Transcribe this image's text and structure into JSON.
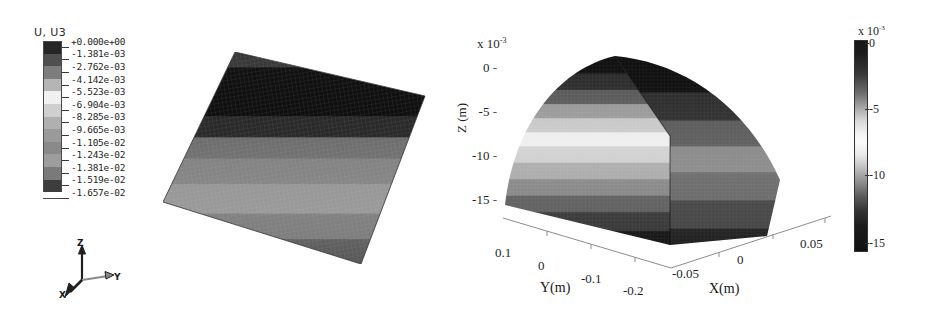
{
  "left_panel": {
    "legend_title": "U, U3",
    "legend_entries": [
      {
        "label": "+0.000e+00",
        "color": "#262626"
      },
      {
        "label": "-1.381e-03",
        "color": "#4f4f4f"
      },
      {
        "label": "-2.762e-03",
        "color": "#7d7d7d"
      },
      {
        "label": "-4.142e-03",
        "color": "#b5b5b5"
      },
      {
        "label": "-5.523e-03",
        "color": "#f0f0f0"
      },
      {
        "label": "-6.904e-03",
        "color": "#cfcfcf"
      },
      {
        "label": "-8.285e-03",
        "color": "#b0b0b0"
      },
      {
        "label": "-9.665e-03",
        "color": "#9a9a9a"
      },
      {
        "label": "-1.105e-02",
        "color": "#8a8a8a"
      },
      {
        "label": "-1.243e-02",
        "color": "#9d9d9d"
      },
      {
        "label": "-1.381e-02",
        "color": "#7a7a7a"
      },
      {
        "label": "-1.519e-02",
        "color": "#3d3d3d"
      },
      {
        "label": "-1.657e-02",
        "color": "#151515"
      }
    ],
    "triad": {
      "z_label": "Z",
      "y_label": "Y",
      "x_label": "X"
    }
  },
  "right_panel": {
    "z_exponent_prefix": "x 10",
    "z_exponent": "-3",
    "z_axis_label": "Z (m)",
    "z_ticks": [
      "0",
      "-5",
      "-10",
      "-15"
    ],
    "y_axis_label": "Y(m)",
    "y_ticks": [
      "0.1",
      "0",
      "-0.1",
      "-0.2"
    ],
    "x_axis_label": "X(m)",
    "x_ticks": [
      "-0.05",
      "0",
      "0.05"
    ],
    "colorbar": {
      "exponent_prefix": "x 10",
      "exponent": "-3",
      "ticks": [
        "0",
        "-5",
        "-10",
        "-15"
      ]
    }
  },
  "chart_data": {
    "type": "heatmap",
    "title": "U, U3",
    "xlabel": "X(m)",
    "ylabel": "Y(m)",
    "zlabel": "Z (m)",
    "xlim": [
      -0.075,
      0.075
    ],
    "ylim": [
      -0.2,
      0.15
    ],
    "zlim": [
      -0.01657,
      0.0
    ],
    "z_scale": 0.001,
    "contour_levels": [
      0.0,
      -0.001381,
      -0.002762,
      -0.004142,
      -0.005523,
      -0.006904,
      -0.008285,
      -0.009665,
      -0.01105,
      -0.01243,
      -0.01381,
      -0.01519,
      -0.01657
    ],
    "colormap": "grayscale-jet",
    "grid": false,
    "legend_position": "left",
    "series": [
      {
        "name": "ABAQUS U3 displacement",
        "min": -0.01657,
        "max": 0.0
      },
      {
        "name": "Analytical Z displacement",
        "min": -0.01657,
        "max": 0.0
      }
    ]
  }
}
